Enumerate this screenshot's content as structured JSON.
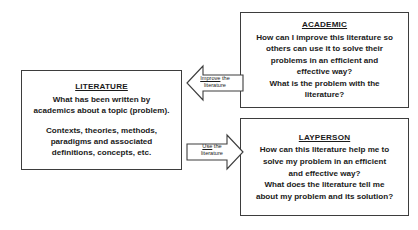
{
  "diagram": {
    "literature": {
      "heading": "LITERATURE",
      "paragraph1": [
        "What has been written by",
        "academics about a topic (problem)."
      ],
      "paragraph2": [
        "Contexts, theories, methods,",
        "paradigms and associated",
        "definitions, concepts, etc."
      ]
    },
    "academic": {
      "heading": "ACADEMIC",
      "lines": [
        "How can I improve this literature so",
        "others can use it to solve their",
        "problems in an efficient and",
        "effective way?",
        "What is the problem with the",
        "literature?"
      ]
    },
    "layperson": {
      "heading": "LAYPERSON",
      "lines": [
        "How can this literature help me to",
        "solve my problem in an efficient",
        "and effective way?",
        "What does the literature tell me",
        "about my problem and its solution?"
      ]
    },
    "arrows": {
      "improve": {
        "keyword": "Improve",
        "rest": " the",
        "line2": "literature",
        "direction": "left"
      },
      "use": {
        "keyword": "Use",
        "rest": " the",
        "line2": "literature",
        "direction": "right"
      }
    },
    "colors": {
      "stroke": "#3d3d3d",
      "text": "#1a1a1a",
      "background": "#ffffff"
    }
  }
}
